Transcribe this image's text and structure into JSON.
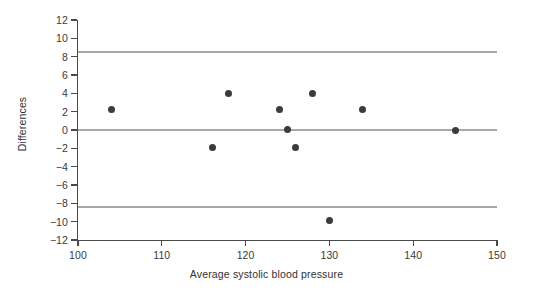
{
  "chart_data": {
    "type": "scatter",
    "title": "",
    "xlabel": "Average systolic blood pressure",
    "ylabel": "Differences",
    "xlim": [
      100,
      150
    ],
    "ylim": [
      -12,
      12
    ],
    "xticks": [
      100,
      110,
      120,
      130,
      140,
      150
    ],
    "xtick_labels": [
      "100",
      "110",
      "120",
      "130",
      "140",
      "150"
    ],
    "yticks": [
      12,
      10,
      8,
      6,
      4,
      2,
      0,
      -2,
      -4,
      -6,
      -8,
      -10,
      -12
    ],
    "ytick_labels": [
      "12",
      "10",
      "8",
      "6",
      "4",
      "2",
      "0",
      "−2",
      "−4",
      "−6",
      "−8",
      "−10",
      "−12"
    ],
    "grid": false,
    "legend": null,
    "marker": "filled-circle",
    "marker_color": "#3b3b3b",
    "x": [
      104,
      116,
      118,
      124,
      125,
      126,
      128,
      130,
      134,
      145
    ],
    "y": [
      2.2,
      -1.9,
      4.0,
      2.2,
      0.1,
      -1.9,
      4.0,
      -9.9,
      2.2,
      0.0
    ],
    "reference_lines": [
      {
        "name": "upper-limit-of-agreement",
        "value": 8.5,
        "color": "#a8a8a8"
      },
      {
        "name": "mean-difference",
        "value": 0.0,
        "color": "#a8a8a8"
      },
      {
        "name": "lower-limit-of-agreement",
        "value": -8.4,
        "color": "#a8a8a8"
      }
    ],
    "axis_color": "#4a4a4a",
    "background": "#ffffff"
  }
}
